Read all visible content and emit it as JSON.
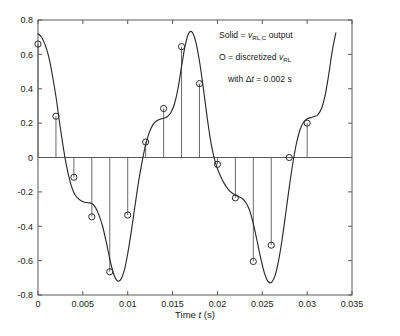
{
  "figure": {
    "background": "#ffffff",
    "axis_color": "#5a5a5a",
    "curve_color": "#2b2b2b"
  },
  "annotations": {
    "line1_prefix": "Solid = ",
    "line1_var": "v",
    "line1_sub": "RL,C",
    "line1_suffix": " output",
    "line2_prefix": "O = discretized ",
    "line2_var": "v",
    "line2_sub": "RL",
    "line3_prefix": "with Δ",
    "line3_var": "t",
    "line3_suffix": " = 0.002 s"
  },
  "axes": {
    "xlabel_prefix": "Time ",
    "xlabel_var": "t",
    "xlabel_suffix": " (s)",
    "ylabel": "",
    "xticks": [
      "0",
      "0.005",
      "0.01",
      "0.015",
      "0.02",
      "0.025",
      "0.03",
      "0.035"
    ],
    "yticks": [
      "0.8",
      "0.6",
      "0.4",
      "0.2",
      "0",
      "-0.2",
      "-0.4",
      "-0.6",
      "-0.8"
    ]
  },
  "chart_data": {
    "type": "line",
    "title": "",
    "xlabel": "Time t (s)",
    "ylabel": "",
    "xlim": [
      0,
      0.035
    ],
    "ylim": [
      -0.8,
      0.8
    ],
    "xtick_values": [
      0,
      0.005,
      0.01,
      0.015,
      0.02,
      0.025,
      0.03,
      0.035
    ],
    "ytick_values": [
      0.8,
      0.6,
      0.4,
      0.2,
      0,
      -0.2,
      -0.4,
      -0.6,
      -0.8
    ],
    "grid": false,
    "legend_position": "upper-right-annotation",
    "series": [
      {
        "name": "Solid = v_RL,C output",
        "style": "solid-line",
        "x": [
          0.0,
          0.0004,
          0.0008,
          0.0012,
          0.0016,
          0.002,
          0.0024,
          0.0028,
          0.0032,
          0.0036,
          0.004,
          0.0044,
          0.0048,
          0.0052,
          0.0056,
          0.006,
          0.0064,
          0.0068,
          0.0072,
          0.0076,
          0.008,
          0.0084,
          0.0088,
          0.0092,
          0.0096,
          0.01,
          0.0104,
          0.0108,
          0.0112,
          0.0116,
          0.012,
          0.0124,
          0.0128,
          0.0132,
          0.0136,
          0.014,
          0.0144,
          0.0148,
          0.0152,
          0.0156,
          0.016,
          0.0164,
          0.0168,
          0.0172,
          0.0176,
          0.018,
          0.0184,
          0.0188,
          0.0192,
          0.0196,
          0.02,
          0.0204,
          0.0208,
          0.0212,
          0.0216,
          0.022,
          0.0224,
          0.0228,
          0.0232,
          0.0236,
          0.024,
          0.0244,
          0.0248,
          0.0252,
          0.0256,
          0.026,
          0.0264,
          0.0268,
          0.0272,
          0.0276,
          0.028,
          0.0284,
          0.0288,
          0.0292,
          0.0296,
          0.03,
          0.0304,
          0.0308,
          0.0312,
          0.0316,
          0.032,
          0.0324,
          0.0328,
          0.0332
        ],
        "y": [
          0.72,
          0.7,
          0.655,
          0.585,
          0.48,
          0.355,
          0.205,
          0.065,
          -0.055,
          -0.145,
          -0.205,
          -0.235,
          -0.252,
          -0.26,
          -0.263,
          -0.268,
          -0.29,
          -0.335,
          -0.4,
          -0.49,
          -0.59,
          -0.672,
          -0.715,
          -0.712,
          -0.66,
          -0.56,
          -0.43,
          -0.285,
          -0.145,
          -0.025,
          0.075,
          0.145,
          0.19,
          0.212,
          0.222,
          0.228,
          0.237,
          0.26,
          0.31,
          0.4,
          0.53,
          0.65,
          0.723,
          0.728,
          0.67,
          0.56,
          0.415,
          0.255,
          0.11,
          0.005,
          -0.065,
          -0.115,
          -0.155,
          -0.185,
          -0.205,
          -0.218,
          -0.228,
          -0.24,
          -0.265,
          -0.31,
          -0.385,
          -0.48,
          -0.58,
          -0.665,
          -0.718,
          -0.727,
          -0.69,
          -0.605,
          -0.48,
          -0.33,
          -0.175,
          -0.035,
          0.08,
          0.16,
          0.205,
          0.225,
          0.232,
          0.238,
          0.25,
          0.285,
          0.36,
          0.48,
          0.62,
          0.725
        ]
      },
      {
        "name": "O = discretized v_RL",
        "style": "stem-with-circle-markers",
        "dt": 0.002,
        "x": [
          0.0,
          0.002,
          0.004,
          0.006,
          0.008,
          0.01,
          0.012,
          0.014,
          0.016,
          0.018,
          0.02,
          0.022,
          0.024,
          0.026,
          0.028,
          0.03
        ],
        "y": [
          0.66,
          0.24,
          -0.115,
          -0.345,
          -0.665,
          -0.335,
          0.09,
          0.285,
          0.645,
          0.43,
          -0.04,
          -0.235,
          -0.605,
          -0.51,
          0.0,
          0.2
        ]
      }
    ]
  }
}
